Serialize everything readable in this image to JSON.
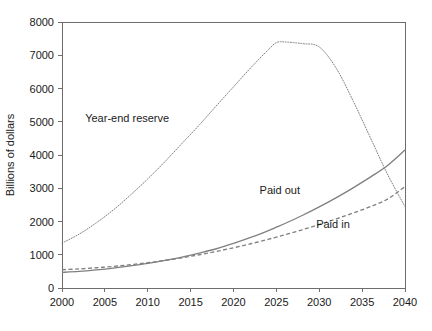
{
  "chart_data": {
    "type": "line",
    "title": "",
    "xlabel": "",
    "ylabel": "Billions of dollars",
    "xlim": [
      2000,
      2040
    ],
    "ylim": [
      0,
      8000
    ],
    "xticks": [
      "2000",
      "2005",
      "2010",
      "2015",
      "2020",
      "2025",
      "2030",
      "2035",
      "2040"
    ],
    "xtick_values": [
      2000,
      2005,
      2010,
      2015,
      2020,
      2025,
      2030,
      2035,
      2040
    ],
    "yticks": [
      "0",
      "1000",
      "2000",
      "3000",
      "4000",
      "5000",
      "6000",
      "7000",
      "8000"
    ],
    "ytick_values": [
      0,
      1000,
      2000,
      3000,
      4000,
      5000,
      6000,
      7000,
      8000
    ],
    "grid": false,
    "legend_position": "inline-annotations",
    "x": [
      2000,
      2002,
      2004,
      2006,
      2008,
      2010,
      2012,
      2014,
      2016,
      2018,
      2020,
      2022,
      2024,
      2025,
      2026,
      2028,
      2030,
      2032,
      2034,
      2036,
      2038,
      2040
    ],
    "series": [
      {
        "name": "Year-end reserve",
        "style": "dotted",
        "color": "#808080",
        "label_text": "Year-end reserve",
        "values": [
          1350,
          1620,
          1960,
          2350,
          2800,
          3280,
          3800,
          4350,
          4900,
          5480,
          6050,
          6620,
          7150,
          7380,
          7400,
          7350,
          7250,
          6600,
          5600,
          4500,
          3400,
          2450
        ]
      },
      {
        "name": "Paid out",
        "style": "solid",
        "color": "#808080",
        "label_text": "Paid out",
        "values": [
          470,
          500,
          545,
          600,
          665,
          740,
          830,
          930,
          1050,
          1180,
          1340,
          1520,
          1720,
          1830,
          1940,
          2180,
          2440,
          2720,
          3020,
          3340,
          3690,
          4150
        ]
      },
      {
        "name": "Paid in",
        "style": "dashed",
        "color": "#808080",
        "label_text": "Paid in",
        "values": [
          550,
          575,
          610,
          650,
          700,
          760,
          830,
          910,
          1000,
          1100,
          1210,
          1330,
          1460,
          1530,
          1600,
          1750,
          1910,
          2080,
          2260,
          2450,
          2680,
          3050
        ]
      }
    ],
    "annotations": [
      {
        "text": "Year-end reserve",
        "x": 2007.6,
        "y": 4980
      },
      {
        "text": "Paid out",
        "x": 2025.4,
        "y": 2830
      },
      {
        "text": "Paid in",
        "x": 2031.6,
        "y": 1790
      }
    ]
  }
}
